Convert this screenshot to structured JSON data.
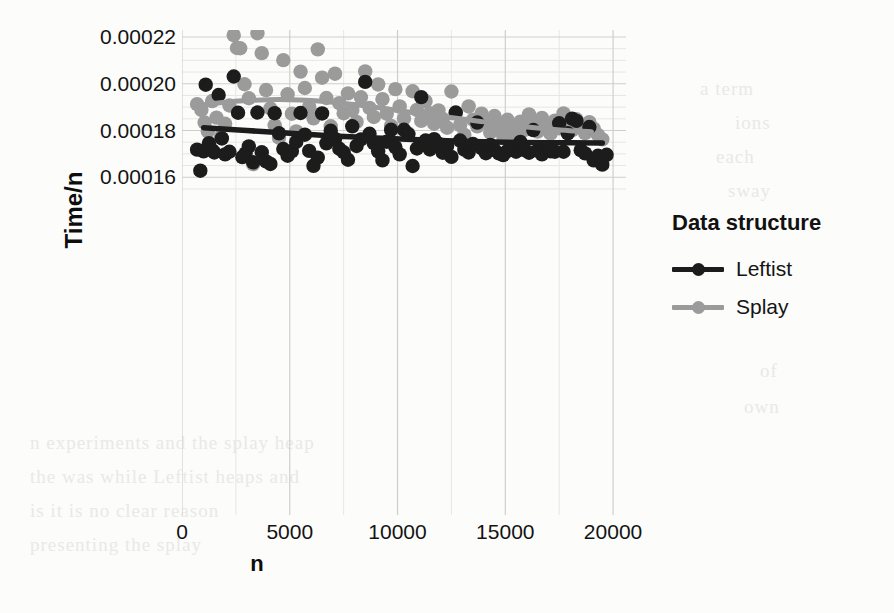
{
  "chart_data": {
    "type": "scatter",
    "title": "",
    "xlabel": "n",
    "ylabel": "Time/n",
    "xlim": [
      0,
      20600
    ],
    "ylim": [
      1.55e-05,
      0.000223
    ],
    "xticks": [
      0,
      5000,
      10000,
      15000,
      20000
    ],
    "xtick_labels": [
      "0",
      "5000",
      "10000",
      "15000",
      "20000"
    ],
    "yticks": [
      0.00016,
      0.00018,
      0.0002,
      0.00022
    ],
    "ytick_labels": [
      "0.00016",
      "0.00018",
      "0.00020",
      "0.00022"
    ],
    "grid": true,
    "legend_position": "right",
    "legend_title": "Data structure",
    "series": [
      {
        "name": "Leftist",
        "color": "#1c1c1c",
        "marker": "circle",
        "points": [
          [
            700,
            0.0001718
          ],
          [
            850,
            0.0001628
          ],
          [
            1000,
            0.0001711
          ],
          [
            1100,
            0.0001996
          ],
          [
            1250,
            0.0001746
          ],
          [
            1400,
            0.0001716
          ],
          [
            1500,
            0.0001706
          ],
          [
            1700,
            0.0001952
          ],
          [
            1850,
            0.0001766
          ],
          [
            2000,
            0.0001698
          ],
          [
            2200,
            0.0001709
          ],
          [
            2400,
            0.0002031
          ],
          [
            2600,
            0.0001876
          ],
          [
            2800,
            0.0001686
          ],
          [
            2950,
            0.0001702
          ],
          [
            3100,
            0.0001732
          ],
          [
            3300,
            0.0001664
          ],
          [
            3500,
            0.0001877
          ],
          [
            3700,
            0.0001707
          ],
          [
            3900,
            0.0001668
          ],
          [
            4100,
            0.0001657
          ],
          [
            4300,
            0.0001874
          ],
          [
            4500,
            0.0001788
          ],
          [
            4700,
            0.0001721
          ],
          [
            4900,
            0.0001692
          ],
          [
            5100,
            0.0001712
          ],
          [
            5300,
            0.0001751
          ],
          [
            5500,
            0.0001875
          ],
          [
            5700,
            0.0001782
          ],
          [
            5900,
            0.0001713
          ],
          [
            6100,
            0.0001649
          ],
          [
            6300,
            0.0001684
          ],
          [
            6500,
            0.0001873
          ],
          [
            6700,
            0.0001745
          ],
          [
            6900,
            0.0001799
          ],
          [
            7100,
            0.0001764
          ],
          [
            7300,
            0.0001722
          ],
          [
            7500,
            0.0001707
          ],
          [
            7700,
            0.0001675
          ],
          [
            7900,
            0.0001818
          ],
          [
            8100,
            0.0001734
          ],
          [
            8300,
            0.0001762
          ],
          [
            8500,
            0.0002008
          ],
          [
            8700,
            0.0001786
          ],
          [
            8900,
            0.0001746
          ],
          [
            9100,
            0.0001711
          ],
          [
            9300,
            0.0001672
          ],
          [
            9500,
            0.0001752
          ],
          [
            9700,
            0.0001803
          ],
          [
            9900,
            0.0001729
          ],
          [
            10100,
            0.0001698
          ],
          [
            10300,
            0.0001803
          ],
          [
            10500,
            0.0001784
          ],
          [
            10700,
            0.0001648
          ],
          [
            10900,
            0.0001723
          ],
          [
            11100,
            0.0001943
          ],
          [
            11300,
            0.0001757
          ],
          [
            11500,
            0.0001719
          ],
          [
            11700,
            0.0001763
          ],
          [
            11900,
            0.0001744
          ],
          [
            12100,
            0.0001705
          ],
          [
            12300,
            0.0001734
          ],
          [
            12500,
            0.0001687
          ],
          [
            12700,
            0.0001877
          ],
          [
            12900,
            0.0001757
          ],
          [
            13100,
            0.0001718
          ],
          [
            13300,
            0.0001706
          ],
          [
            13500,
            0.0001742
          ],
          [
            13700,
            0.0001834
          ],
          [
            13900,
            0.0001724
          ],
          [
            14100,
            0.0001703
          ],
          [
            14300,
            0.0001738
          ],
          [
            14500,
            0.0001716
          ],
          [
            14700,
            0.0001702
          ],
          [
            14900,
            0.0001695
          ],
          [
            15100,
            0.0001713
          ],
          [
            15300,
            0.0001724
          ],
          [
            15500,
            0.0001709
          ],
          [
            15700,
            0.0001751
          ],
          [
            15900,
            0.0001716
          ],
          [
            16100,
            0.0001705
          ],
          [
            16300,
            0.0001802
          ],
          [
            16500,
            0.0001714
          ],
          [
            16700,
            0.0001698
          ],
          [
            16900,
            0.0001727
          ],
          [
            17100,
            0.0001711
          ],
          [
            17300,
            0.0001709
          ],
          [
            17500,
            0.0001831
          ],
          [
            17700,
            0.0001709
          ],
          [
            17900,
            0.0001788
          ],
          [
            18100,
            0.0001851
          ],
          [
            18300,
            0.0001841
          ],
          [
            18500,
            0.0001716
          ],
          [
            18700,
            0.0001702
          ],
          [
            18900,
            0.0001815
          ],
          [
            19100,
            0.0001672
          ],
          [
            19300,
            0.0001692
          ],
          [
            19500,
            0.0001654
          ],
          [
            19700,
            0.0001696
          ]
        ],
        "smooth": [
          [
            1000,
            0.0001812
          ],
          [
            3000,
            0.00018
          ],
          [
            5000,
            0.0001788
          ],
          [
            7000,
            0.0001777
          ],
          [
            9000,
            0.0001768
          ],
          [
            11000,
            0.000176
          ],
          [
            13000,
            0.0001754
          ],
          [
            15000,
            0.000175
          ],
          [
            17000,
            0.0001748
          ],
          [
            19500,
            0.0001747
          ]
        ]
      },
      {
        "name": "Splay",
        "color": "#9b9b9b",
        "marker": "circle",
        "points": [
          [
            700,
            0.0001913
          ],
          [
            900,
            0.0001888
          ],
          [
            1050,
            0.0001834
          ],
          [
            1200,
            0.0001796
          ],
          [
            1400,
            0.0001926
          ],
          [
            1600,
            0.0001855
          ],
          [
            1800,
            0.0001772
          ],
          [
            2000,
            0.0001829
          ],
          [
            2200,
            0.0001907
          ],
          [
            2400,
            0.0002208
          ],
          [
            2550,
            0.0002153
          ],
          [
            2700,
            0.0002152
          ],
          [
            2900,
            0.0001998
          ],
          [
            3100,
            0.0001938
          ],
          [
            3300,
            0.0001656
          ],
          [
            3500,
            0.0002216
          ],
          [
            3700,
            0.0002131
          ],
          [
            3900,
            0.0001973
          ],
          [
            4100,
            0.0001894
          ],
          [
            4300,
            0.0001822
          ],
          [
            4500,
            0.0001769
          ],
          [
            4700,
            0.0002101
          ],
          [
            4900,
            0.0001955
          ],
          [
            5100,
            0.0001872
          ],
          [
            5300,
            0.0001796
          ],
          [
            5500,
            0.0002052
          ],
          [
            5700,
            0.0001982
          ],
          [
            5900,
            0.0001901
          ],
          [
            6100,
            0.0001852
          ],
          [
            6300,
            0.0002147
          ],
          [
            6500,
            0.0002026
          ],
          [
            6700,
            0.0001939
          ],
          [
            6900,
            0.0001818
          ],
          [
            7100,
            0.0002043
          ],
          [
            7300,
            0.0001917
          ],
          [
            7500,
            0.0001874
          ],
          [
            7700,
            0.0001959
          ],
          [
            7900,
            0.0001886
          ],
          [
            8100,
            0.0001837
          ],
          [
            8300,
            0.0001942
          ],
          [
            8500,
            0.0002053
          ],
          [
            8700,
            0.0001897
          ],
          [
            8900,
            0.0001858
          ],
          [
            9100,
            0.0001997
          ],
          [
            9300,
            0.0001934
          ],
          [
            9500,
            0.0001872
          ],
          [
            9700,
            0.000182
          ],
          [
            9900,
            0.0001977
          ],
          [
            10100,
            0.0001903
          ],
          [
            10300,
            0.0001851
          ],
          [
            10500,
            0.0001787
          ],
          [
            10700,
            0.0001968
          ],
          [
            10900,
            0.0001888
          ],
          [
            11100,
            0.0001841
          ],
          [
            11300,
            0.0001926
          ],
          [
            11500,
            0.0001874
          ],
          [
            11700,
            0.0001829
          ],
          [
            11900,
            0.0001886
          ],
          [
            12100,
            0.0001849
          ],
          [
            12300,
            0.0001812
          ],
          [
            12500,
            0.0001967
          ],
          [
            12700,
            0.0001874
          ],
          [
            12900,
            0.0001823
          ],
          [
            13100,
            0.0001781
          ],
          [
            13300,
            0.0001903
          ],
          [
            13500,
            0.0001846
          ],
          [
            13700,
            0.0001818
          ],
          [
            13900,
            0.0001872
          ],
          [
            14100,
            0.0001836
          ],
          [
            14300,
            0.0001791
          ],
          [
            14500,
            0.0001862
          ],
          [
            14700,
            0.0001824
          ],
          [
            14900,
            0.0001778
          ],
          [
            15100,
            0.0001846
          ],
          [
            15300,
            0.0001811
          ],
          [
            15500,
            0.0001772
          ],
          [
            15700,
            0.0001838
          ],
          [
            15900,
            0.0001803
          ],
          [
            16100,
            0.0001869
          ],
          [
            16300,
            0.0001827
          ],
          [
            16500,
            0.0001795
          ],
          [
            16700,
            0.0001854
          ],
          [
            16900,
            0.0001818
          ],
          [
            17100,
            0.0001786
          ],
          [
            17300,
            0.0001842
          ],
          [
            17500,
            0.0001809
          ],
          [
            17700,
            0.0001873
          ],
          [
            17900,
            0.0001831
          ],
          [
            18100,
            0.0001801
          ],
          [
            18300,
            0.0001848
          ],
          [
            18500,
            0.0001818
          ],
          [
            18700,
            0.0001789
          ],
          [
            18900,
            0.0001836
          ],
          [
            19100,
            0.0001808
          ],
          [
            19300,
            0.0001781
          ],
          [
            19500,
            0.0001762
          ]
        ],
        "smooth": [
          [
            1000,
            0.000191
          ],
          [
            2000,
            0.0001921
          ],
          [
            3000,
            0.0001928
          ],
          [
            4000,
            0.0001932
          ],
          [
            5000,
            0.0001932
          ],
          [
            6000,
            0.0001928
          ],
          [
            7000,
            0.0001921
          ],
          [
            8000,
            0.0001911
          ],
          [
            9000,
            0.0001899
          ],
          [
            10000,
            0.0001886
          ],
          [
            11000,
            0.0001873
          ],
          [
            12000,
            0.0001861
          ],
          [
            13000,
            0.0001849
          ],
          [
            14000,
            0.0001837
          ],
          [
            15000,
            0.0001826
          ],
          [
            16000,
            0.0001815
          ],
          [
            17000,
            0.0001806
          ],
          [
            18000,
            0.0001799
          ],
          [
            19000,
            0.0001795
          ]
        ]
      }
    ]
  },
  "legend": {
    "title": "Data structure",
    "items": [
      {
        "label": "Leftist",
        "color": "#1c1c1c"
      },
      {
        "label": "Splay",
        "color": "#9b9b9b"
      }
    ]
  },
  "axes": {
    "x_label": "n",
    "y_label": "Time/n",
    "x_tick_labels": [
      "0",
      "5000",
      "10000",
      "15000",
      "20000"
    ],
    "y_tick_labels": [
      "0.00016",
      "0.00018",
      "0.00020",
      "0.00022"
    ]
  },
  "page_artifacts": {
    "lines": [
      "a term",
      "ions",
      "each",
      "sway",
      "of",
      "own",
      "n experiments and the splay heap",
      "the was while Leftist heaps and",
      "is it is no clear reason",
      "presenting the splay"
    ]
  }
}
